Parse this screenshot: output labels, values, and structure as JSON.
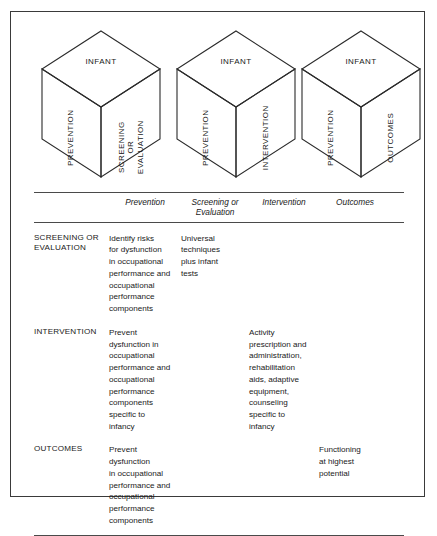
{
  "figure": {
    "cubes": [
      {
        "id": "cube-screening",
        "top_label": "INFANT",
        "left_label": "PREVENTION",
        "right_label": "SCREENING\nOR\nEVALUATION"
      },
      {
        "id": "cube-intervention",
        "top_label": "INFANT",
        "left_label": "PREVENTION",
        "right_label": "INTERVENTION"
      },
      {
        "id": "cube-outcomes",
        "top_label": "INFANT",
        "left_label": "PREVENTION",
        "right_label": "OUTCOMES"
      }
    ],
    "table": {
      "corner_header": "",
      "columns": [
        "Prevention",
        "Screening or\nEvaluation",
        "Intervention",
        "Outcomes"
      ],
      "rows": [
        {
          "label": "SCREENING OR\nEVALUATION",
          "cells": [
            "Identify risks\nfor dysfunction\nin occupational\nperformance and\noccupational\nperformance\ncomponents",
            "Universal\ntechniques\nplus infant\ntests",
            "",
            ""
          ]
        },
        {
          "label": "INTERVENTION",
          "cells": [
            "Prevent\ndysfunction in\noccupational\nperformance and\noccupational\nperformance\ncomponents\nspecific to\ninfancy",
            "",
            "Activity\nprescription and\nadministration,\nrehabilitation\naids, adaptive\nequipment,\ncounseling\nspecific to\ninfancy",
            ""
          ]
        },
        {
          "label": "OUTCOMES",
          "cells": [
            "Prevent\ndysfunction\nin occupational\nperformance and\noccupational\nperformance\ncomponents",
            "",
            "",
            "Functioning\nat highest\npotential"
          ]
        }
      ]
    }
  }
}
